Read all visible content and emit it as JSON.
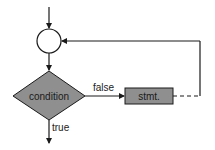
{
  "diagram": {
    "type": "flowchart",
    "title": "",
    "nodes": [
      {
        "id": "junction",
        "shape": "circle",
        "label": ""
      },
      {
        "id": "condition",
        "shape": "diamond",
        "label": "condition"
      },
      {
        "id": "stmt",
        "shape": "rectangle",
        "label": "stmt."
      }
    ],
    "edges": [
      {
        "from": "entry",
        "to": "junction",
        "label": "",
        "style": "solid"
      },
      {
        "from": "junction",
        "to": "condition",
        "label": "",
        "style": "solid"
      },
      {
        "from": "condition",
        "to": "stmt",
        "label": "false",
        "style": "solid"
      },
      {
        "from": "stmt",
        "to": "junction",
        "label": "",
        "style": "dashed-then-solid"
      },
      {
        "from": "condition",
        "to": "exit",
        "label": "true",
        "style": "solid"
      }
    ],
    "labels": {
      "condition": "condition",
      "stmt": "stmt.",
      "false_edge": "false",
      "true_edge": "true"
    },
    "colors": {
      "node_fill": "#8f8f8f",
      "stroke": "#1a1a1a",
      "background": "#ffffff"
    }
  }
}
